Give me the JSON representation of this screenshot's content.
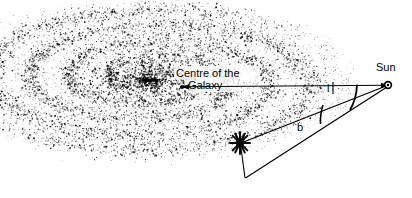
{
  "figure": {
    "width": 412,
    "height": 198,
    "background_color": "#ffffff",
    "ink_color": "#000000"
  },
  "labels": {
    "galactic_centre_line1": "Centre of the",
    "galactic_centre_line2": "Galaxy",
    "sun": "Sun",
    "galactic_longitude": "l",
    "galactic_latitude": "b"
  },
  "markers": {
    "galactic_centre": {
      "x": 182,
      "y": 87,
      "kind": "filled-dot"
    },
    "sun": {
      "x": 388,
      "y": 85,
      "kind": "small-circle"
    },
    "star": {
      "x": 240,
      "y": 143,
      "kind": "starburst"
    },
    "plane_projection": {
      "x": 245,
      "y": 178,
      "kind": "vertex"
    }
  },
  "lines": [
    {
      "name": "galactic-plane-baseline",
      "from": [
        182,
        87
      ],
      "to": [
        388,
        85
      ],
      "style": "solid",
      "arrows": "both"
    },
    {
      "name": "sun-to-star-sightline",
      "from": [
        388,
        85
      ],
      "to": [
        240,
        143
      ],
      "style": "solid"
    },
    {
      "name": "sun-to-projection-line",
      "from": [
        388,
        85
      ],
      "to": [
        245,
        178
      ],
      "style": "solid"
    },
    {
      "name": "star-drop-line",
      "from": [
        240,
        143
      ],
      "to": [
        245,
        178
      ],
      "style": "solid"
    }
  ],
  "angles": [
    {
      "name": "longitude-arc",
      "label": "l",
      "vertex": "sun",
      "between": [
        "galactic-plane-baseline",
        "sun-to-projection-line"
      ]
    },
    {
      "name": "latitude-arc",
      "label": "b",
      "vertex": "sun",
      "between": [
        "sun-to-star-sightline",
        "sun-to-projection-line"
      ]
    }
  ],
  "galaxy": {
    "description": "stippled spiral galaxy seen at an oblique angle",
    "dot_count": 9000,
    "centre": [
      150,
      80
    ],
    "disk_radius_x": 200,
    "disk_radius_y": 78
  }
}
